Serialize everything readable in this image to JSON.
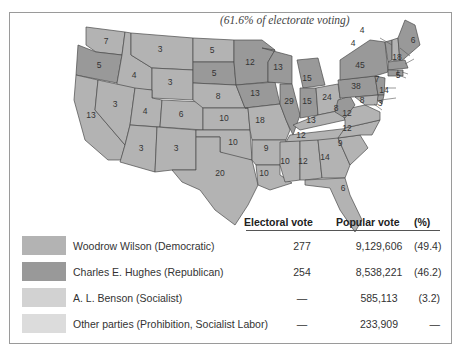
{
  "caption": "(61.6% of electorate voting)",
  "colors": {
    "democratic": "#b3b3b3",
    "republican": "#999999",
    "socialist": "#d2d2d2",
    "other": "#dcdcdc",
    "border": "#4a4a4a"
  },
  "table": {
    "headers": {
      "electoral": "Electoral vote",
      "popular": "Popular vote",
      "pct": "(%)"
    },
    "rows": [
      {
        "name": "Woodrow Wilson (Democratic)",
        "electoral": "277",
        "popular": "9,129,606",
        "pct": "(49.4)"
      },
      {
        "name": "Charles E. Hughes (Republican)",
        "electoral": "254",
        "popular": "8,538,221",
        "pct": "(46.2)"
      },
      {
        "name": "A. L. Benson (Socialist)",
        "electoral": "—",
        "popular": "585,113",
        "pct": "(3.2)"
      },
      {
        "name": "Other parties (Prohibition, Socialist Labor)",
        "electoral": "—",
        "popular": "233,909",
        "pct": "—"
      }
    ]
  },
  "states": {
    "WA": "7",
    "OR": "5",
    "CA": "13",
    "ID": "4",
    "NV": "3",
    "MT": "3",
    "WY": "3",
    "UT": "4",
    "AZ": "3",
    "CO": "6",
    "NM": "3",
    "ND": "5",
    "SD": "5",
    "NE": "8",
    "KS": "10",
    "OK": "10",
    "TX": "20",
    "MN": "12",
    "IA": "13",
    "MO": "18",
    "AR": "9",
    "LA": "10",
    "WI": "13",
    "IL": "29",
    "MI": "15",
    "IN": "15",
    "OH": "24",
    "KY": "13",
    "TN": "12",
    "MS": "10",
    "AL": "12",
    "GA": "14",
    "FL": "6",
    "SC": "9",
    "NC": "12",
    "VA": "12",
    "WV": "8",
    "PA": "38",
    "NY": "45",
    "ME": "6",
    "NH": "4",
    "VT": "4",
    "MA": "18",
    "RI": "5",
    "CT": "7",
    "NJ": "14",
    "DE": "3",
    "MD": "8"
  }
}
